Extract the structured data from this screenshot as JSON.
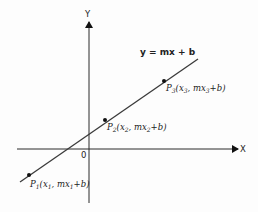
{
  "diagram": {
    "axes": {
      "x_label": "X",
      "y_label": "Y",
      "origin_label": "0"
    },
    "equation_label": "y = mx + b",
    "points": [
      {
        "id": "P1",
        "name": "P",
        "index": "1",
        "coord_x": "x",
        "coord_sub": "1",
        "coord_y_prefix": "mx",
        "coord_y_suffix": "+b"
      },
      {
        "id": "P2",
        "name": "P",
        "index": "2",
        "coord_x": "x",
        "coord_sub": "2",
        "coord_y_prefix": "mx",
        "coord_y_suffix": "+b"
      },
      {
        "id": "P3",
        "name": "P",
        "index": "3",
        "coord_x": "x",
        "coord_sub": "3",
        "coord_y_prefix": "mx",
        "coord_y_suffix": "+b"
      }
    ]
  }
}
